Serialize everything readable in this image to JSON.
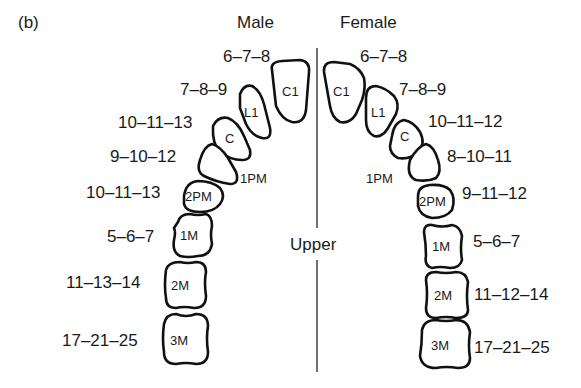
{
  "panel_label": "(b)",
  "headers": {
    "male": "Male",
    "female": "Female",
    "center": "Upper"
  },
  "male": {
    "teeth": [
      {
        "name": "C1",
        "ages": "6–7–8"
      },
      {
        "name": "L1",
        "ages": "7–8–9"
      },
      {
        "name": "C",
        "ages": "10–11–13"
      },
      {
        "name": "1PM",
        "ages": "9–10–12"
      },
      {
        "name": "2PM",
        "ages": "10–11–13"
      },
      {
        "name": "1M",
        "ages": "5–6–7"
      },
      {
        "name": "2M",
        "ages": "11–13–14"
      },
      {
        "name": "3M",
        "ages": "17–21–25"
      }
    ]
  },
  "female": {
    "teeth": [
      {
        "name": "C1",
        "ages": "6–7–8"
      },
      {
        "name": "L1",
        "ages": "7–8–9"
      },
      {
        "name": "C",
        "ages": "10–11–12"
      },
      {
        "name": "1PM",
        "ages": "8–10–11"
      },
      {
        "name": "2PM",
        "ages": "9–11–12"
      },
      {
        "name": "1M",
        "ages": "5–6–7"
      },
      {
        "name": "2M",
        "ages": "11–12–14"
      },
      {
        "name": "3M",
        "ages": "17–21–25"
      }
    ]
  },
  "colors": {
    "outline": "#111111",
    "text": "#1a1a1a",
    "background": "#ffffff"
  }
}
